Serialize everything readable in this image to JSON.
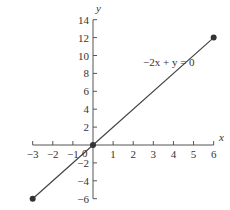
{
  "chart_data": {
    "type": "line",
    "title": "",
    "xlabel": "x",
    "ylabel": "y",
    "xlim": [
      -3,
      6
    ],
    "ylim": [
      -6,
      14
    ],
    "x_ticks": [
      -3,
      -2,
      -1,
      0,
      1,
      2,
      3,
      4,
      5,
      6
    ],
    "x_tick_labels": [
      "−3",
      "−2",
      "−1",
      "0",
      "1",
      "2",
      "3",
      "4",
      "5",
      "6"
    ],
    "y_ticks": [
      -6,
      -4,
      -2,
      2,
      4,
      6,
      8,
      10,
      12,
      14
    ],
    "y_tick_labels": [
      "−6",
      "−4",
      "−2",
      "2",
      "4",
      "6",
      "8",
      "10",
      "12",
      "14"
    ],
    "grid": false,
    "legend": null,
    "series": [
      {
        "name": "−2x + y = 0",
        "x": [
          -3,
          0,
          6
        ],
        "y": [
          -6,
          0,
          12
        ],
        "marked_points": [
          [
            -3,
            -6
          ],
          [
            0,
            0
          ],
          [
            6,
            12
          ]
        ],
        "color": "#444444"
      }
    ],
    "annotations": [
      {
        "text": "−2x + y = 0",
        "x": 2.5,
        "y": 9.2
      }
    ]
  },
  "labels": {
    "x_axis": "x",
    "y_axis": "y",
    "origin": "0",
    "equation": "−2x + y = 0"
  },
  "colors": {
    "axis": "#555555",
    "line": "#444444",
    "point": "#333333",
    "text": "#333333"
  }
}
